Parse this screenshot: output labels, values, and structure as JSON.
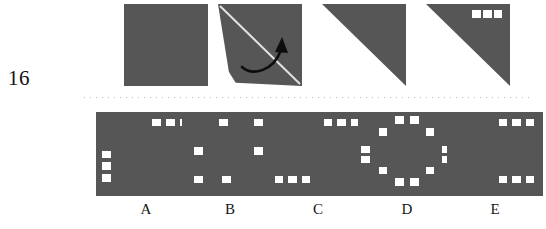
{
  "question": {
    "number": "16",
    "type": "paper-folding-punch",
    "colors": {
      "paper_gray": "#565656",
      "hole_white": "#ffffff",
      "background": "#ffffff",
      "divider_dots": "#b9b9b9",
      "text": "#151515"
    }
  },
  "prompt_row": {
    "name": "fold-sequence",
    "steps": [
      {
        "id": "step-1",
        "label": "unfolded-square",
        "shape": "full-square",
        "fill": "solid-gray",
        "holes": []
      },
      {
        "id": "step-2",
        "label": "folding-in-progress",
        "shape": "folding-flap",
        "fill": "solid-gray",
        "crease": "diagonal-top-left-to-bottom-right",
        "arrow": "curved-fold-arrow",
        "holes": []
      },
      {
        "id": "step-3",
        "label": "folded-triangle",
        "shape": "upper-right-triangle",
        "fill": "solid-gray",
        "holes": []
      },
      {
        "id": "step-4",
        "label": "punched-triangle",
        "shape": "upper-right-triangle",
        "fill": "solid-gray",
        "holes": [
          {
            "x": 55,
            "y": 7,
            "w": 10,
            "h": 10
          },
          {
            "x": 68,
            "y": 7,
            "w": 10,
            "h": 10
          },
          {
            "x": 81,
            "y": 7,
            "w": 10,
            "h": 10
          }
        ]
      }
    ]
  },
  "options_row": {
    "name": "answer-options",
    "options": [
      {
        "letter": "A",
        "holes": [
          {
            "x": 56,
            "y": 8,
            "w": 9,
            "h": 9
          },
          {
            "x": 70,
            "y": 8,
            "w": 9,
            "h": 9
          },
          {
            "x": 84,
            "y": 8,
            "w": 9,
            "h": 9
          },
          {
            "x": 6,
            "y": 46,
            "w": 9,
            "h": 9
          },
          {
            "x": 6,
            "y": 60,
            "w": 9,
            "h": 9
          },
          {
            "x": 6,
            "y": 74,
            "w": 9,
            "h": 9
          }
        ]
      },
      {
        "letter": "B",
        "holes": [
          {
            "x": 39,
            "y": 8,
            "w": 9,
            "h": 9
          },
          {
            "x": 75,
            "y": 8,
            "w": 9,
            "h": 9
          },
          {
            "x": 13,
            "y": 42,
            "w": 9,
            "h": 9
          },
          {
            "x": 75,
            "y": 42,
            "w": 9,
            "h": 9
          },
          {
            "x": 13,
            "y": 76,
            "w": 9,
            "h": 9
          },
          {
            "x": 42,
            "y": 76,
            "w": 9,
            "h": 9
          }
        ]
      },
      {
        "letter": "C",
        "holes": [
          {
            "x": 56,
            "y": 8,
            "w": 9,
            "h": 9
          },
          {
            "x": 70,
            "y": 8,
            "w": 9,
            "h": 9
          },
          {
            "x": 84,
            "y": 8,
            "w": 9,
            "h": 9
          },
          {
            "x": 5,
            "y": 76,
            "w": 9,
            "h": 9
          },
          {
            "x": 19,
            "y": 76,
            "w": 9,
            "h": 9
          },
          {
            "x": 33,
            "y": 76,
            "w": 9,
            "h": 9
          }
        ]
      },
      {
        "letter": "D",
        "holes": [
          {
            "x": 38,
            "y": 5,
            "w": 9,
            "h": 9
          },
          {
            "x": 53,
            "y": 5,
            "w": 9,
            "h": 9
          },
          {
            "x": 21,
            "y": 19,
            "w": 9,
            "h": 9
          },
          {
            "x": 69,
            "y": 19,
            "w": 9,
            "h": 9
          },
          {
            "x": 3,
            "y": 40,
            "w": 9,
            "h": 9
          },
          {
            "x": 86,
            "y": 40,
            "w": 9,
            "h": 9
          },
          {
            "x": 3,
            "y": 52,
            "w": 9,
            "h": 9
          },
          {
            "x": 86,
            "y": 52,
            "w": 9,
            "h": 9
          },
          {
            "x": 21,
            "y": 65,
            "w": 9,
            "h": 9
          },
          {
            "x": 69,
            "y": 65,
            "w": 9,
            "h": 9
          },
          {
            "x": 38,
            "y": 79,
            "w": 9,
            "h": 9
          },
          {
            "x": 53,
            "y": 79,
            "w": 9,
            "h": 9
          }
        ]
      },
      {
        "letter": "E",
        "holes": [
          {
            "x": 54,
            "y": 8,
            "w": 9,
            "h": 9
          },
          {
            "x": 68,
            "y": 8,
            "w": 9,
            "h": 9
          },
          {
            "x": 82,
            "y": 8,
            "w": 9,
            "h": 9
          },
          {
            "x": 54,
            "y": 76,
            "w": 9,
            "h": 9
          },
          {
            "x": 68,
            "y": 76,
            "w": 9,
            "h": 9
          },
          {
            "x": 82,
            "y": 76,
            "w": 9,
            "h": 9
          }
        ]
      }
    ]
  }
}
